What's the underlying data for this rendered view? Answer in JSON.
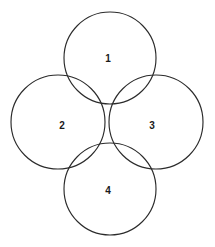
{
  "diagram": {
    "type": "venn-like-circle-arrangement",
    "canvas": {
      "width": 215,
      "height": 247,
      "background": "#ffffff"
    },
    "stroke_color": "#2b2b2b",
    "stroke_width": 1.15,
    "label_color": "#1a1a1a",
    "circles": [
      {
        "id": "circle-1",
        "label": "1",
        "cx": 110,
        "cy": 58,
        "r": 46,
        "position": "top",
        "label_x": 108,
        "label_y": 58
      },
      {
        "id": "circle-2",
        "label": "2",
        "cx": 58,
        "cy": 122,
        "r": 47,
        "position": "left",
        "label_x": 62,
        "label_y": 125
      },
      {
        "id": "circle-3",
        "label": "3",
        "cx": 156,
        "cy": 122,
        "r": 47,
        "position": "right",
        "label_x": 152,
        "label_y": 125
      },
      {
        "id": "circle-4",
        "label": "4",
        "cx": 110,
        "cy": 189,
        "r": 46,
        "position": "bottom",
        "label_x": 108,
        "label_y": 190
      }
    ],
    "labels": [
      "1",
      "2",
      "3",
      "4"
    ]
  }
}
